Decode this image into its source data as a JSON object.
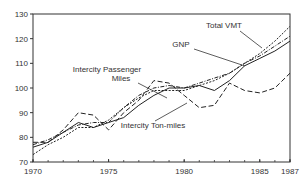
{
  "chart_data": {
    "type": "line",
    "title": "",
    "xlabel": "",
    "ylabel": "",
    "xlim": [
      1970,
      1987
    ],
    "ylim": [
      70,
      130
    ],
    "grid": false,
    "legend": "inline labels",
    "x_ticks": [
      1970,
      1975,
      1980,
      1985,
      1987
    ],
    "y_ticks": [
      70,
      80,
      90,
      100,
      110,
      120,
      130
    ],
    "x": [
      1970,
      1971,
      1972,
      1973,
      1974,
      1975,
      1976,
      1977,
      1978,
      1979,
      1980,
      1981,
      1982,
      1983,
      1984,
      1985,
      1986,
      1987
    ],
    "series": [
      {
        "name": "Total VMT",
        "style": "short-dash",
        "values": [
          73,
          77,
          80,
          84,
          84,
          87,
          92,
          96,
          99,
          99,
          99,
          101,
          103,
          106,
          110,
          114,
          119,
          125
        ]
      },
      {
        "name": "GNP",
        "style": "solid",
        "values": [
          76,
          78,
          82,
          86,
          84,
          86,
          88,
          93,
          97,
          100,
          100,
          101,
          99,
          103,
          109,
          112,
          115,
          119
        ]
      },
      {
        "name": "Intercity Passenger Miles",
        "style": "dash-dot",
        "values": [
          77,
          79,
          82,
          85,
          86,
          86,
          92,
          97,
          100,
          101,
          100,
          102,
          104,
          106,
          110,
          113,
          117,
          121
        ]
      },
      {
        "name": "Intercity Ton-miles",
        "style": "long-dash",
        "values": [
          78,
          78,
          83,
          90,
          89,
          83,
          90,
          95,
          103,
          102,
          97,
          92,
          93,
          102,
          99,
          98,
          100,
          106
        ]
      }
    ],
    "annotations": [
      {
        "text": "Total VMT",
        "x": 224,
        "y": 28
      },
      {
        "text": "GNP",
        "x": 181,
        "y": 47
      },
      {
        "text": "Intercity Passenger",
        "x": 107,
        "y": 72
      },
      {
        "text": "Miles",
        "x": 121,
        "y": 81
      },
      {
        "text": "Intercity Ton-miles",
        "x": 153,
        "y": 128
      }
    ]
  }
}
